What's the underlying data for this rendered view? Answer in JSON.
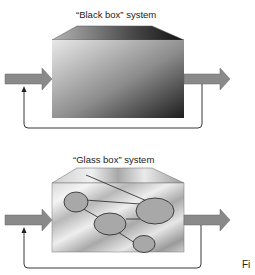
{
  "diagram": {
    "black_box": {
      "title": "“Black box” system",
      "nodes": [],
      "input_arrow": "input-arrow",
      "output_arrow": "output-arrow",
      "feedback": "feedback-loop"
    },
    "glass_box": {
      "title": "“Glass box” system",
      "nodes": [
        "node-1",
        "node-2",
        "node-3",
        "node-4"
      ],
      "edges": [
        [
          "node-1",
          "node-2"
        ],
        [
          "node-1",
          "node-3"
        ],
        [
          "node-3",
          "node-2"
        ],
        [
          "node-3",
          "node-4"
        ]
      ],
      "input_arrow": "input-arrow",
      "output_arrow": "output-arrow",
      "feedback": "feedback-loop"
    },
    "caption_fragment": "Fi"
  },
  "colors": {
    "arrow_fill": "#8a8a8a",
    "node_fill": "#a8a8a8",
    "line": "#222222"
  }
}
